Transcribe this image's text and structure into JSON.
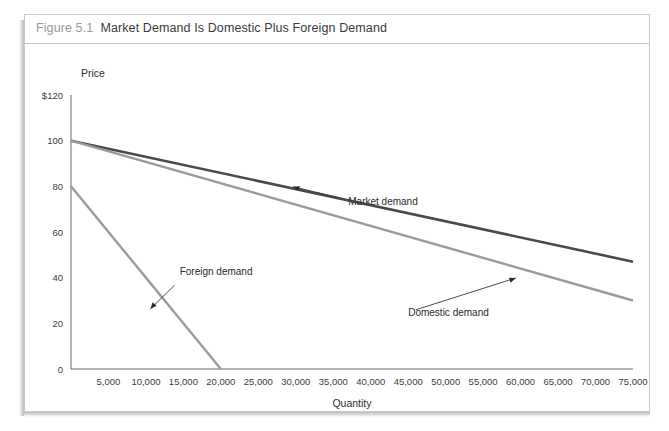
{
  "figure": {
    "number": "Figure 5.1",
    "title": "Market Demand Is Domestic Plus Foreign Demand"
  },
  "colors": {
    "market": "#4a4a4a",
    "domestic": "#9b9b9b",
    "foreign": "#9b9b9b",
    "axis": "#6b6b6b",
    "caption_number": "#9a9a9a",
    "caption_title": "#3a3a3a",
    "frame_border": "#c9c9c9"
  },
  "chart_data": {
    "type": "line",
    "title": "Market Demand Is Domestic Plus Foreign Demand",
    "xlabel": "Quantity",
    "ylabel": "Price",
    "xlim": [
      0,
      75000
    ],
    "ylim": [
      0,
      120
    ],
    "grid": false,
    "legend": "none",
    "x_ticks": [
      5000,
      10000,
      15000,
      20000,
      25000,
      30000,
      35000,
      40000,
      45000,
      50000,
      55000,
      60000,
      65000,
      70000,
      75000
    ],
    "x_tick_labels": [
      "5,000",
      "10,000",
      "15,000",
      "20,000",
      "25,000",
      "30,000",
      "35,000",
      "40,000",
      "45,000",
      "50,000",
      "55,000",
      "60,000",
      "65,000",
      "70,000",
      "75,000"
    ],
    "y_ticks": [
      0,
      20,
      40,
      60,
      80,
      100,
      120
    ],
    "y_tick_labels": [
      "0",
      "20",
      "40",
      "60",
      "80",
      "100",
      "$120"
    ],
    "series": [
      {
        "name": "Market demand",
        "color": "#4a4a4a",
        "points": [
          [
            0,
            100
          ],
          [
            75000,
            47
          ]
        ]
      },
      {
        "name": "Domestic demand",
        "color": "#9b9b9b",
        "points": [
          [
            0,
            100
          ],
          [
            75000,
            30
          ]
        ]
      },
      {
        "name": "Foreign demand",
        "color": "#9b9b9b",
        "points": [
          [
            0,
            80
          ],
          [
            20000,
            0
          ]
        ]
      }
    ],
    "annotations": [
      {
        "text": "Market demand",
        "label_x": 37000,
        "label_y": 72,
        "point_x": 29500,
        "point_y": 80,
        "anchor": "start"
      },
      {
        "text": "Foreign demand",
        "label_x": 14500,
        "label_y": 41,
        "point_x": 10500,
        "point_y": 26,
        "anchor": "start"
      },
      {
        "text": "Domestic demand",
        "label_x": 45000,
        "label_y": 23,
        "point_x": 59500,
        "point_y": 40,
        "anchor": "start"
      }
    ]
  }
}
